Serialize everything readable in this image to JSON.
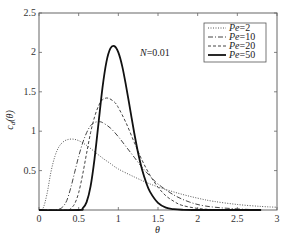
{
  "chart_data": {
    "type": "line",
    "title": "",
    "xlabel": "θ",
    "ylabel": "c_d(θ)",
    "xlim": [
      0,
      3
    ],
    "ylim": [
      0,
      2.5
    ],
    "xticks": [
      "0",
      "0.5",
      "1",
      "1.5",
      "2",
      "2.5",
      "3"
    ],
    "xtick_values": [
      0,
      0.5,
      1,
      1.5,
      2,
      2.5,
      3
    ],
    "yticks": [
      "0.5",
      "1",
      "1.5",
      "2",
      "2.5"
    ],
    "ytick_values": [
      0.5,
      1,
      1.5,
      2,
      2.5
    ],
    "grid": false,
    "legend_position": "upper right",
    "annotation": "N=0.01",
    "series": [
      {
        "name": "Pe=2",
        "style": "dotted",
        "width": 1,
        "color": "#555555",
        "peak": [
          0.42,
          0.9
        ],
        "x": [
          0.0,
          0.05,
          0.1,
          0.15,
          0.2,
          0.25,
          0.3,
          0.35,
          0.42,
          0.5,
          0.6,
          0.7,
          0.8,
          0.9,
          1.0,
          1.2,
          1.4,
          1.6,
          1.8,
          2.0,
          2.2,
          2.5,
          2.8,
          3.0
        ],
        "y": [
          0.0,
          0.02,
          0.2,
          0.48,
          0.68,
          0.8,
          0.86,
          0.89,
          0.9,
          0.88,
          0.82,
          0.74,
          0.66,
          0.59,
          0.52,
          0.42,
          0.33,
          0.26,
          0.2,
          0.15,
          0.11,
          0.07,
          0.045,
          0.035
        ]
      },
      {
        "name": "Pe=10",
        "style": "dashdot",
        "width": 1,
        "color": "#444444",
        "peak": [
          0.75,
          1.12
        ],
        "x": [
          0.0,
          0.2,
          0.25,
          0.3,
          0.35,
          0.4,
          0.45,
          0.5,
          0.55,
          0.6,
          0.65,
          0.7,
          0.75,
          0.8,
          0.9,
          1.0,
          1.1,
          1.2,
          1.3,
          1.4,
          1.5,
          1.7,
          1.9,
          2.1,
          2.4,
          2.8
        ],
        "y": [
          0.0,
          0.0,
          0.01,
          0.04,
          0.12,
          0.28,
          0.48,
          0.68,
          0.85,
          0.98,
          1.07,
          1.11,
          1.12,
          1.11,
          1.04,
          0.93,
          0.8,
          0.67,
          0.54,
          0.43,
          0.33,
          0.19,
          0.1,
          0.05,
          0.02,
          0.0
        ]
      },
      {
        "name": "Pe=20",
        "style": "dashed",
        "width": 1,
        "color": "#444444",
        "peak": [
          0.87,
          1.42
        ],
        "x": [
          0.0,
          0.35,
          0.4,
          0.45,
          0.5,
          0.55,
          0.6,
          0.65,
          0.7,
          0.75,
          0.8,
          0.87,
          0.95,
          1.0,
          1.1,
          1.2,
          1.3,
          1.4,
          1.5,
          1.6,
          1.7,
          1.8,
          2.0,
          2.2,
          2.5
        ],
        "y": [
          0.0,
          0.0,
          0.02,
          0.08,
          0.22,
          0.45,
          0.72,
          0.98,
          1.18,
          1.32,
          1.4,
          1.42,
          1.37,
          1.3,
          1.1,
          0.86,
          0.63,
          0.44,
          0.29,
          0.18,
          0.11,
          0.06,
          0.02,
          0.005,
          0.0
        ]
      },
      {
        "name": "Pe=50",
        "style": "solid",
        "width": 1.8,
        "color": "#111111",
        "peak": [
          0.95,
          2.08
        ],
        "x": [
          0.0,
          0.5,
          0.55,
          0.6,
          0.65,
          0.7,
          0.75,
          0.8,
          0.85,
          0.9,
          0.95,
          1.0,
          1.05,
          1.1,
          1.15,
          1.2,
          1.25,
          1.3,
          1.35,
          1.4,
          1.5,
          1.6,
          1.7,
          1.8,
          2.0,
          2.8
        ],
        "y": [
          0.0,
          0.0,
          0.02,
          0.1,
          0.3,
          0.65,
          1.1,
          1.55,
          1.88,
          2.05,
          2.08,
          2.0,
          1.82,
          1.56,
          1.27,
          0.98,
          0.72,
          0.51,
          0.35,
          0.23,
          0.09,
          0.03,
          0.01,
          0.003,
          0.0,
          0.0
        ]
      }
    ]
  },
  "legend": {
    "items": [
      "Pe=2",
      "Pe=10",
      "Pe=20",
      "Pe=50"
    ],
    "prefix": "Pe",
    "values": [
      "=2",
      "=10",
      "=20",
      "=50"
    ]
  },
  "annotation": {
    "italic": "N",
    "rest": "=0.01"
  },
  "axes": {
    "xlabel": "θ",
    "ylabel_main": "c",
    "ylabel_sub": "d",
    "ylabel_arg": "(θ)"
  }
}
